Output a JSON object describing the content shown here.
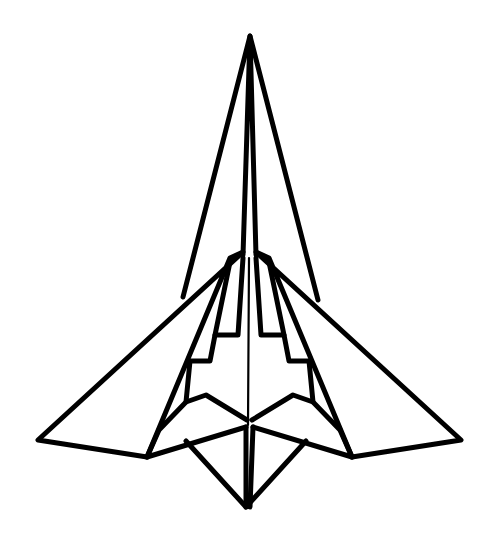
{
  "figure": {
    "title": "Paper airplane line drawing",
    "stroke_color": "#000000",
    "background_color": "#ffffff"
  }
}
